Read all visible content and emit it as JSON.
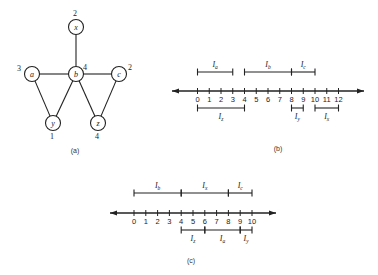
{
  "figure_a": {
    "caption": "(a)",
    "nodes": [
      {
        "id": "x",
        "label": "x",
        "degree_label": "2",
        "cx": 76,
        "cy": 27
      },
      {
        "id": "a",
        "label": "a",
        "degree_label": "3",
        "cx": 32,
        "cy": 74
      },
      {
        "id": "b",
        "label": "b",
        "degree_label": "4",
        "cx": 76,
        "cy": 74
      },
      {
        "id": "c",
        "label": "c",
        "degree_label": "2",
        "cx": 119,
        "cy": 74
      },
      {
        "id": "y",
        "label": "y",
        "degree_label": "1",
        "cx": 53,
        "cy": 123
      },
      {
        "id": "z",
        "label": "z",
        "degree_label": "4",
        "cx": 98,
        "cy": 123
      }
    ],
    "edges": [
      [
        "x",
        "b"
      ],
      [
        "a",
        "b"
      ],
      [
        "b",
        "c"
      ],
      [
        "a",
        "y"
      ],
      [
        "y",
        "b"
      ],
      [
        "b",
        "z"
      ],
      [
        "z",
        "c"
      ]
    ]
  },
  "figure_b": {
    "caption": "(b)",
    "axis": {
      "min": 0,
      "max": 12,
      "ticks": [
        "0",
        "1",
        "2",
        "3",
        "4",
        "5",
        "6",
        "7",
        "8",
        "9",
        "10",
        "11",
        "12"
      ]
    },
    "intervals_above": [
      {
        "name": "I",
        "sub": "a",
        "start": 0,
        "end": 3
      },
      {
        "name": "I",
        "sub": "b",
        "start": 4,
        "end": 8
      },
      {
        "name": "I",
        "sub": "c",
        "start": 8,
        "end": 10
      }
    ],
    "intervals_below": [
      {
        "name": "I",
        "sub": "z",
        "start": 0,
        "end": 4
      },
      {
        "name": "I",
        "sub": "y",
        "start": 8,
        "end": 9
      },
      {
        "name": "I",
        "sub": "x",
        "start": 10,
        "end": 12
      }
    ]
  },
  "figure_c": {
    "caption": "(c)",
    "axis": {
      "min": 0,
      "max": 10,
      "ticks": [
        "0",
        "1",
        "2",
        "3",
        "4",
        "5",
        "6",
        "7",
        "8",
        "9",
        "10"
      ]
    },
    "intervals_above": [
      {
        "name": "I",
        "sub": "b",
        "start": 0,
        "end": 4
      },
      {
        "name": "I",
        "sub": "x",
        "start": 4,
        "end": 8
      },
      {
        "name": "I",
        "sub": "c",
        "start": 8,
        "end": 10
      }
    ],
    "intervals_below": [
      {
        "name": "I",
        "sub": "z",
        "start": 4,
        "end": 6
      },
      {
        "name": "I",
        "sub": "a",
        "start": 6,
        "end": 9
      },
      {
        "name": "I",
        "sub": "y",
        "start": 9,
        "end": 10
      }
    ]
  }
}
